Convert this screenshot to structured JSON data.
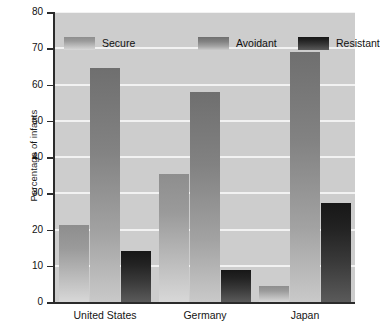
{
  "chart_data": {
    "type": "bar",
    "title": "",
    "subtitle": "",
    "xlabel": "",
    "ylabel": "Percentage of infants",
    "categories": [
      "United States",
      "Germany",
      "Japan"
    ],
    "series": [
      {
        "name": "Secure",
        "values": [
          21.3,
          35.4,
          4.4
        ],
        "color": "#9a9a9a"
      },
      {
        "name": "Avoidant",
        "values": [
          64.6,
          57.9,
          69.0
        ],
        "color": "#868686"
      },
      {
        "name": "Resistant",
        "values": [
          14.0,
          8.8,
          27.3
        ],
        "color": "#242424"
      }
    ],
    "ylim": [
      0,
      80
    ],
    "yticks": [
      0,
      10,
      20,
      30,
      40,
      50,
      60,
      70,
      80
    ],
    "ytick_labels": [
      "0",
      "10",
      "20",
      "30",
      "40",
      "50",
      "60",
      "70",
      "80"
    ],
    "grid": true,
    "grid_axis": "y",
    "grid_color": "#f2f2f2",
    "plot_background": "#cdcdcd",
    "legend_position": "top-inside",
    "legend_entries": [
      "Secure",
      "Avoidant",
      "Resistant"
    ]
  }
}
